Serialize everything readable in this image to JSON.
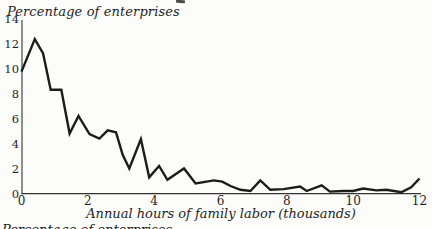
{
  "chart_data": {
    "type": "line",
    "title": "",
    "y_axis_title": "Percentage of enterprises",
    "xlabel": "Annual hours of family labor (thousands)",
    "ylabel": "Percentage of enterprises",
    "xlim": [
      0,
      12
    ],
    "ylim": [
      0,
      14
    ],
    "x_ticks": [
      0,
      2,
      4,
      6,
      8,
      10,
      12
    ],
    "y_ticks": [
      0,
      2,
      4,
      6,
      8,
      10,
      12,
      14
    ],
    "grid": false,
    "legend": null,
    "line_color": "#1c1c1c",
    "axis_color": "#333333",
    "text_color": "#1f1f1f",
    "x": [
      0,
      0.4,
      0.65,
      0.88,
      1.2,
      1.45,
      1.72,
      2.05,
      2.35,
      2.6,
      2.85,
      3.05,
      3.25,
      3.6,
      3.85,
      4.15,
      4.4,
      4.9,
      5.25,
      5.8,
      6.05,
      6.3,
      6.6,
      6.9,
      7.2,
      7.5,
      7.9,
      8.4,
      8.6,
      9.05,
      9.3,
      9.7,
      10.0,
      10.3,
      10.7,
      11.0,
      11.45,
      11.75,
      12.0
    ],
    "values": [
      9.75,
      12.35,
      11.2,
      8.3,
      8.3,
      4.8,
      6.2,
      4.75,
      4.4,
      5.05,
      4.9,
      3.1,
      2.0,
      4.35,
      1.3,
      2.2,
      1.1,
      2.0,
      0.8,
      1.05,
      0.95,
      0.6,
      0.3,
      0.2,
      1.05,
      0.3,
      0.35,
      0.55,
      0.2,
      0.65,
      0.15,
      0.2,
      0.2,
      0.4,
      0.25,
      0.3,
      0.1,
      0.5,
      1.2
    ]
  },
  "artifacts": {
    "bottom_cropped_text": "Percentage of enterprises"
  }
}
